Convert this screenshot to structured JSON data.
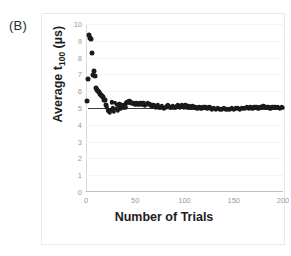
{
  "figure": {
    "panel_label": "(B)"
  },
  "chart_data": {
    "type": "scatter",
    "title": "",
    "xlabel": "Number of Trials",
    "ylabel": "Average t100 (µs)",
    "ylabel_base": "Average t",
    "ylabel_sub": "100",
    "ylabel_unit": " (µs)",
    "xlim": [
      0,
      200
    ],
    "ylim": [
      0,
      10
    ],
    "xticks": [
      0,
      50,
      100,
      150,
      200
    ],
    "yticks": [
      0,
      1,
      2,
      3,
      4,
      5,
      6,
      7,
      8,
      9,
      10
    ],
    "grid": true,
    "legend": "none",
    "marker_color": "#1a1a1a",
    "reference_line": {
      "y": 5.0,
      "x_start": 2,
      "x_end": 200,
      "color": "#3a3a3a"
    },
    "x": [
      1,
      2,
      3,
      4,
      5,
      6,
      7,
      8,
      9,
      10,
      11,
      12,
      13,
      14,
      15,
      16,
      17,
      18,
      19,
      20,
      21,
      22,
      23,
      24,
      25,
      26,
      27,
      28,
      29,
      30,
      31,
      32,
      33,
      34,
      35,
      36,
      37,
      38,
      39,
      40,
      41,
      42,
      43,
      44,
      45,
      46,
      47,
      48,
      49,
      50,
      51,
      52,
      53,
      54,
      55,
      56,
      57,
      58,
      59,
      60,
      61,
      62,
      63,
      64,
      65,
      66,
      67,
      68,
      69,
      70,
      71,
      72,
      73,
      74,
      75,
      76,
      77,
      78,
      79,
      80,
      81,
      82,
      83,
      84,
      85,
      86,
      87,
      88,
      89,
      90,
      91,
      92,
      93,
      94,
      95,
      96,
      97,
      98,
      99,
      100,
      101,
      102,
      103,
      104,
      105,
      106,
      107,
      108,
      109,
      110,
      111,
      112,
      113,
      114,
      115,
      116,
      117,
      118,
      119,
      120,
      121,
      122,
      123,
      124,
      125,
      126,
      127,
      128,
      129,
      130,
      131,
      132,
      133,
      134,
      135,
      136,
      137,
      138,
      139,
      140,
      141,
      142,
      143,
      144,
      145,
      146,
      147,
      148,
      149,
      150,
      151,
      152,
      153,
      154,
      155,
      156,
      157,
      158,
      159,
      160,
      161,
      162,
      163,
      164,
      165,
      166,
      167,
      168,
      169,
      170,
      171,
      172,
      173,
      174,
      175,
      176,
      177,
      178,
      179,
      180,
      181,
      182,
      183,
      184,
      185,
      186,
      187,
      188,
      189,
      190,
      191,
      192,
      193,
      194,
      195,
      196,
      197,
      198,
      199,
      200
    ],
    "y": [
      5.4,
      6.7,
      9.35,
      9.15,
      9.1,
      8.3,
      6.95,
      7.2,
      6.9,
      6.2,
      6.1,
      6.0,
      5.95,
      5.85,
      5.8,
      5.7,
      5.65,
      5.5,
      5.45,
      5.2,
      5.05,
      4.85,
      4.8,
      4.75,
      4.9,
      5.35,
      5.0,
      4.8,
      5.3,
      4.95,
      5.2,
      4.85,
      5.1,
      5.25,
      4.95,
      5.2,
      5.1,
      5.0,
      5.15,
      5.05,
      5.3,
      5.35,
      5.3,
      5.4,
      5.35,
      5.3,
      5.25,
      5.3,
      5.25,
      5.2,
      5.3,
      5.25,
      5.2,
      5.25,
      5.3,
      5.2,
      5.25,
      5.3,
      5.2,
      5.15,
      5.2,
      5.25,
      5.3,
      5.2,
      5.25,
      5.15,
      5.1,
      5.15,
      5.2,
      5.1,
      5.05,
      5.1,
      5.15,
      5.05,
      5.0,
      5.05,
      5.1,
      5.0,
      4.95,
      5.0,
      5.05,
      5.1,
      5.15,
      5.1,
      5.05,
      5.0,
      5.05,
      5.1,
      5.05,
      5.0,
      5.05,
      5.1,
      5.15,
      5.1,
      5.05,
      5.1,
      5.15,
      5.1,
      5.05,
      5.1,
      5.15,
      5.1,
      5.05,
      5.1,
      5.05,
      5.0,
      5.05,
      5.1,
      5.05,
      5.0,
      5.05,
      5.0,
      4.95,
      5.0,
      5.05,
      5.0,
      4.95,
      5.0,
      5.05,
      5.0,
      5.05,
      5.0,
      4.95,
      5.0,
      5.05,
      5.0,
      4.95,
      4.9,
      4.95,
      5.0,
      4.95,
      4.9,
      4.95,
      5.0,
      4.95,
      4.9,
      4.95,
      4.9,
      4.95,
      5.0,
      4.95,
      4.9,
      4.95,
      4.9,
      4.95,
      4.9,
      4.95,
      5.0,
      4.95,
      4.9,
      4.95,
      5.0,
      4.95,
      5.0,
      4.95,
      4.9,
      4.95,
      5.0,
      4.95,
      5.0,
      4.95,
      5.0,
      5.05,
      5.0,
      4.95,
      5.0,
      5.05,
      5.0,
      4.95,
      5.0,
      5.05,
      5.0,
      5.05,
      5.0,
      4.95,
      5.0,
      5.05,
      5.0,
      5.05,
      5.1,
      5.05,
      5.0,
      5.05,
      5.0,
      5.05,
      5.0,
      4.95,
      5.0,
      5.05,
      5.0,
      5.05,
      5.0,
      5.05,
      5.0,
      5.05,
      5.0,
      4.95,
      5.0,
      5.05,
      5.0
    ]
  }
}
